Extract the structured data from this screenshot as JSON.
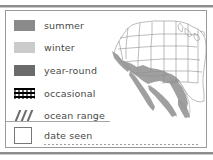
{
  "card": {
    "legend": {
      "items": [
        {
          "label": "summer",
          "swatch_type": "solid",
          "color": "#8a8a8a"
        },
        {
          "label": "winter",
          "swatch_type": "solid",
          "color": "#cbcbcb"
        },
        {
          "label": "year-round",
          "swatch_type": "solid",
          "color": "#6b6b6b"
        },
        {
          "label": "occasional",
          "swatch_type": "dotted",
          "color": "#6e6e6e"
        },
        {
          "label": "ocean range",
          "swatch_type": "hatch",
          "color": "#6b6b6b"
        }
      ]
    },
    "date_seen": {
      "label": "date seen",
      "value": "",
      "checkbox_checked": false
    },
    "map": {
      "name": "united-states-range-map",
      "region_shade_color": "#9b9b9b",
      "outline_color": "#8f8f8f",
      "background_color": "#ffffff"
    }
  },
  "colors": {
    "rule": "#8c8c8c",
    "card_border": "#9a9a9a",
    "text": "#4a4a4a"
  }
}
